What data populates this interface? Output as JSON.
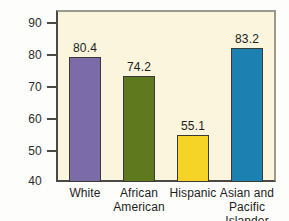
{
  "chart_data": {
    "type": "bar",
    "title": "",
    "subtitle": "",
    "xlabel": "",
    "ylabel": "",
    "ylim": [
      40,
      95
    ],
    "y_ticks": [
      40,
      50,
      60,
      70,
      80,
      90
    ],
    "grid": false,
    "legend": "none",
    "categories": [
      "White",
      "African American",
      "Hispanic",
      "Asian and Pacific Islander"
    ],
    "category_lines": [
      [
        "White"
      ],
      [
        "African",
        "American"
      ],
      [
        "Hispanic"
      ],
      [
        "Asian and",
        "Pacific Islander"
      ]
    ],
    "values": [
      80.4,
      74.2,
      55.1,
      83.2
    ],
    "value_labels": [
      "80.4",
      "74.2",
      "55.1",
      "83.2"
    ],
    "bar_colors": [
      "#7B6BA8",
      "#5F7A1E",
      "#F6D327",
      "#1C81B0"
    ],
    "plot_background": "#FAF5DC",
    "axis_color": "#4A4A44"
  },
  "axis": {
    "y_tick_labels": [
      "90",
      "80",
      "70",
      "60",
      "50",
      "40"
    ]
  }
}
